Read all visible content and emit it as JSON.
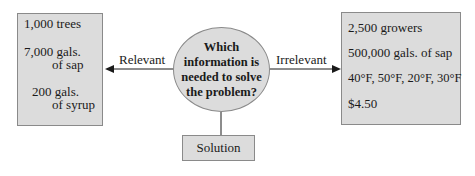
{
  "diagram": {
    "center": {
      "lines": [
        "Which",
        "information is",
        "needed to solve",
        "the problem?"
      ]
    },
    "left_arrow_label": "Relevant",
    "right_arrow_label": "Irrelevant",
    "relevant_box": {
      "items": [
        {
          "num": "1,000",
          "unit": "trees"
        },
        {
          "num": "7,000",
          "unit": "gals.",
          "unit2": "of sap"
        },
        {
          "num": "200",
          "unit": "gals.",
          "unit2": "of syrup"
        }
      ]
    },
    "irrelevant_box": {
      "items": [
        "2,500 growers",
        "500,000 gals. of sap",
        "40°F, 50°F, 20°F, 30°F",
        "$4.50"
      ]
    },
    "solution_label": "Solution",
    "colors": {
      "fill": "#dcdcdc",
      "stroke": "#8a8a8a",
      "line": "#1a1a1a"
    }
  }
}
